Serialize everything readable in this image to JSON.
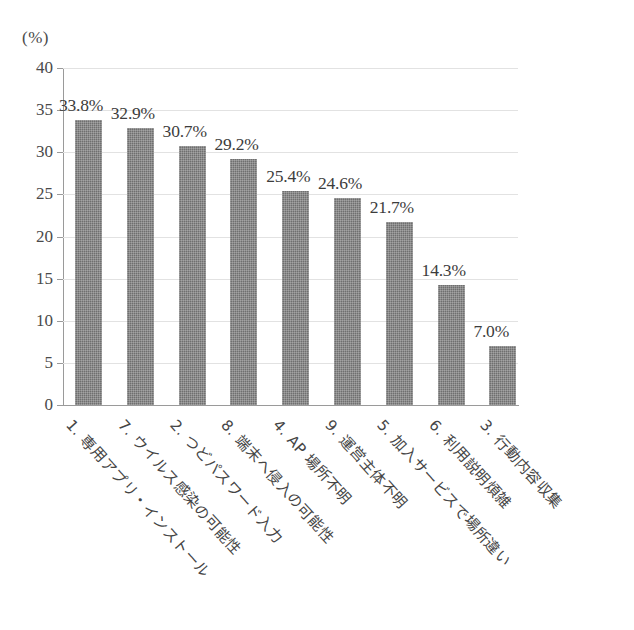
{
  "chart_data": {
    "type": "bar",
    "title": "",
    "subtitle": "",
    "xlabel": "",
    "ylabel": "(%)",
    "ylim": [
      0,
      40
    ],
    "ytick_step": 5,
    "yticks": [
      "40",
      "35",
      "30",
      "25",
      "20",
      "15",
      "10",
      "5",
      "0"
    ],
    "ytick_values": [
      40,
      35,
      30,
      25,
      20,
      15,
      10,
      5,
      0
    ],
    "grid": true,
    "grid_axis": "y",
    "legend": false,
    "legend_position": "none",
    "bar_color": "#6f6f6f",
    "categories": [
      "1. 専用アプリ・インストール",
      "7. ウイルス感染の可能性",
      "2. つどパスワード入力",
      "8. 端末へ侵入の可能性",
      "4. AP 場所不明",
      "9. 運営主体不明",
      "5. 加入サービスで場所違い",
      "6. 利用説明煩雑",
      "3. 行動内容収集"
    ],
    "values": [
      33.8,
      32.9,
      30.7,
      29.2,
      25.4,
      24.6,
      21.7,
      14.3,
      7.0
    ],
    "data_labels": [
      "33.8%",
      "32.9%",
      "30.7%",
      "29.2%",
      "25.4%",
      "24.6%",
      "21.7%",
      "14.3%",
      "7.0%"
    ]
  }
}
